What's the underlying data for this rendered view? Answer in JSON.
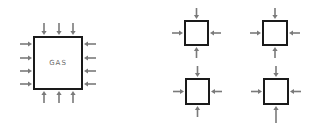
{
  "diagram": {
    "large_box": {
      "label": "GAS",
      "x": 34,
      "y": 37,
      "w": 48,
      "h": 52,
      "arrows": {
        "top": [
          44,
          59,
          73
        ],
        "bottom": [
          44,
          59,
          73
        ],
        "left": [
          44,
          58,
          71,
          84
        ],
        "right": [
          44,
          58,
          71,
          84
        ]
      }
    },
    "small_boxes": [
      {
        "id": "top-left",
        "x": 185,
        "y": 21,
        "w": 23,
        "h": 24
      },
      {
        "id": "top-right",
        "x": 263,
        "y": 21,
        "w": 24,
        "h": 24
      },
      {
        "id": "bottom-left",
        "x": 186,
        "y": 79,
        "w": 23,
        "h": 25
      },
      {
        "id": "bottom-right",
        "x": 264,
        "y": 79,
        "w": 24,
        "h": 25,
        "long_bottom_arrow": true
      }
    ],
    "colors": {
      "box_stroke": "#1a1a1a",
      "arrow": "#7a7a7a",
      "label": "#6a6a6a"
    }
  }
}
